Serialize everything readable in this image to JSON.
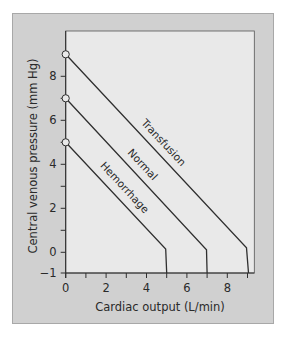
{
  "chart_data": {
    "type": "line",
    "title": "",
    "xlabel": "Cardiac output (L/min)",
    "ylabel": "Central venous pressure (mm Hg)",
    "xlim": [
      0,
      9.4
    ],
    "ylim": [
      -1,
      10
    ],
    "x_ticks": [
      0,
      1,
      2,
      3,
      4,
      5,
      6,
      7,
      8,
      9
    ],
    "x_tick_labels": [
      {
        "value": 0,
        "label": "0"
      },
      {
        "value": 2,
        "label": "2"
      },
      {
        "value": 4,
        "label": "4"
      },
      {
        "value": 6,
        "label": "6"
      },
      {
        "value": 8,
        "label": "8"
      }
    ],
    "y_ticks": [
      0,
      1,
      2,
      3,
      4,
      5,
      6,
      7,
      8
    ],
    "y_tick_labels": [
      {
        "value": -1,
        "label": "−1"
      },
      {
        "value": 0,
        "label": "0"
      },
      {
        "value": 2,
        "label": "2"
      },
      {
        "value": 4,
        "label": "4"
      },
      {
        "value": 6,
        "label": "6"
      },
      {
        "value": 8,
        "label": "8"
      }
    ],
    "grid": false,
    "legend": "inline labels along lines",
    "series": [
      {
        "name": "Transfusion",
        "points": [
          [
            0,
            9
          ],
          [
            8.95,
            0.2
          ],
          [
            9.05,
            -1
          ]
        ],
        "start_marker": "open-circle",
        "label_pos": [
          161,
          145
        ]
      },
      {
        "name": "Normal",
        "points": [
          [
            0,
            7
          ],
          [
            6.97,
            0.12
          ],
          [
            7.0,
            -1
          ]
        ],
        "start_marker": "open-circle",
        "label_pos": [
          140,
          167
        ]
      },
      {
        "name": "Hemorrhage",
        "points": [
          [
            0,
            5
          ],
          [
            4.95,
            0.15
          ],
          [
            5.0,
            -1
          ]
        ],
        "start_marker": "open-circle",
        "label_pos": [
          122,
          190
        ]
      }
    ]
  },
  "colors": {
    "page_bg": "#ffffff",
    "panel_bg": "#d0d0d0",
    "panel_border": "#a8a8a8",
    "plot_bg": "#e9e9e9",
    "plot_border": "#555555",
    "line": "#2f2f2f",
    "text": "#2a2a2a"
  }
}
